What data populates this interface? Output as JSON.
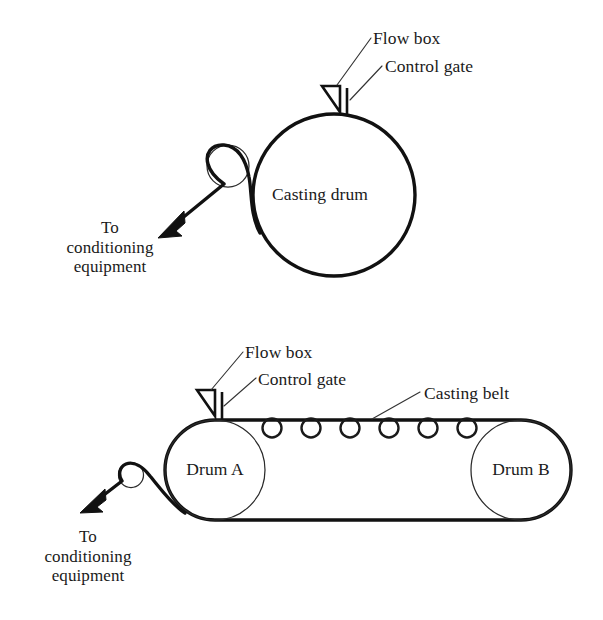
{
  "figure": {
    "background_color": "#ffffff",
    "line_color": "#111111",
    "text_color": "#1a1a1a"
  },
  "top_diagram": {
    "name": "casting-drum-process",
    "drum_label": "Casting drum",
    "flow_box_label": "Flow box",
    "control_gate_label": "Control gate",
    "exit_label_line1": "To",
    "exit_label_line2": "conditioning",
    "exit_label_line3": "equipment",
    "exit_label_full": "To conditioning equipment"
  },
  "bottom_diagram": {
    "name": "casting-belt-process",
    "flow_box_label": "Flow box",
    "control_gate_label": "Control gate",
    "casting_belt_label": "Casting belt",
    "drum_a_label": "Drum A",
    "drum_b_label": "Drum B",
    "exit_label_line1": "To",
    "exit_label_line2": "conditioning",
    "exit_label_line3": "equipment",
    "exit_label_full": "To conditioning equipment",
    "support_roller_count": 6
  }
}
